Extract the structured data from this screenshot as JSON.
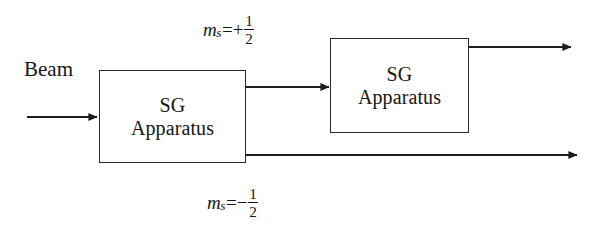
{
  "diagram": {
    "background_color": "#ffffff",
    "stroke_color": "#2b2b2b",
    "text_color": "#151515"
  },
  "beam": {
    "label": "Beam"
  },
  "boxes": [
    {
      "id": "sg-apparatus-1",
      "line1": "SG",
      "line2": "Apparatus",
      "x": 99,
      "y": 70,
      "width": 147,
      "height": 93
    },
    {
      "id": "sg-apparatus-2",
      "line1": "SG",
      "line2": "Apparatus",
      "x": 330,
      "y": 38,
      "width": 139,
      "height": 95
    }
  ],
  "labels": {
    "spin_up": {
      "variable": "m",
      "subscript": "s",
      "relation": "=+",
      "numerator": "1",
      "denominator": "2",
      "full_text": "m_s=+1/2"
    },
    "spin_down": {
      "variable": "m",
      "subscript": "s",
      "relation": "=−",
      "numerator": "1",
      "denominator": "2",
      "full_text": "m_s=−1/2"
    }
  },
  "arrows": [
    {
      "name": "input-beam-arrow",
      "x1": 27,
      "y1": 117,
      "x2": 99,
      "y2": 117
    },
    {
      "name": "upper-output-arrow-1",
      "x1": 246,
      "y1": 87,
      "x2": 330,
      "y2": 87
    },
    {
      "name": "lower-output-arrow-1",
      "x1": 246,
      "y1": 155,
      "x2": 578,
      "y2": 155
    },
    {
      "name": "upper-output-arrow-2",
      "x1": 469,
      "y1": 47,
      "x2": 572,
      "y2": 47
    }
  ]
}
